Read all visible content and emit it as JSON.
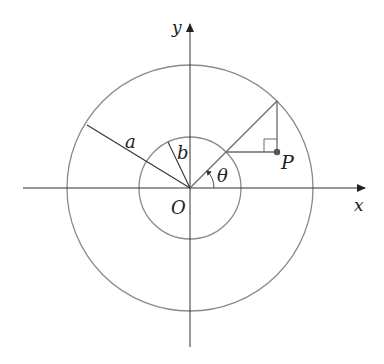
{
  "figure": {
    "type": "geometric-diagram",
    "colors": {
      "axis": "#222222",
      "circle": "#8a8a8a",
      "construction": "#6a6a6a",
      "point": "#555555"
    }
  },
  "labels": {
    "y_axis": "y",
    "x_axis": "x",
    "origin": "O",
    "outer_radius": "a",
    "inner_radius": "b",
    "angle": "θ",
    "point": "P"
  }
}
